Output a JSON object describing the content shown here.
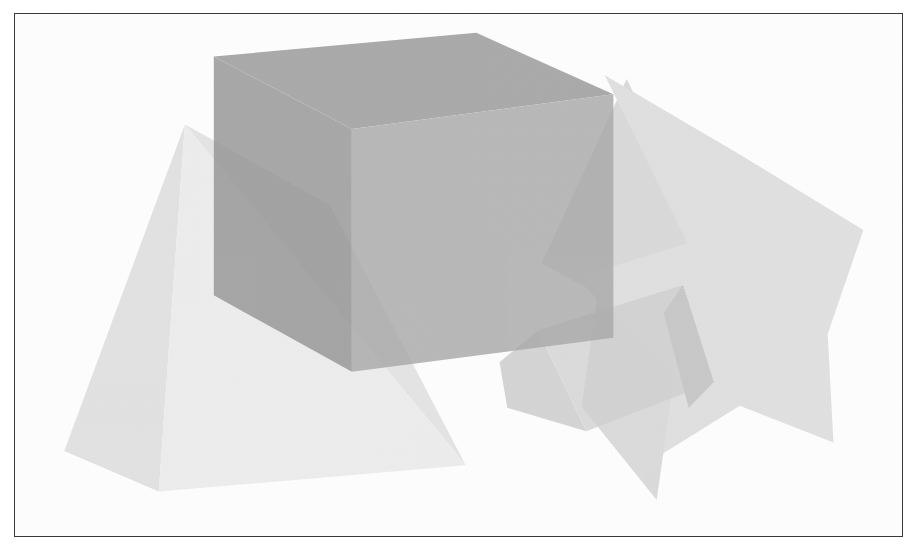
{
  "scene": {
    "title": "Overlapping translucent 3D solids",
    "background_color": "#ffffff",
    "frame_color": "#3a3a3a",
    "frame_style": "thin rectangular border",
    "render_mode": "grayscale halftone",
    "width": 919,
    "height": 553
  },
  "palette": {
    "cube_top_dark": "#6e6e6e",
    "cube_left_dark": "#6a6a6a",
    "cube_right_mid": "#8a8a8a",
    "pyramid_left_light": "#c8c8c8",
    "pyramid_front_lightest": "#dddddd",
    "star_body": "#c2c2c2",
    "star_shade": "#b4b4b4",
    "wedge_light": "#bdbdbd",
    "wedge_shade": "#aaaaaa",
    "overlap_blend": "#9a9a9a"
  },
  "shapes": [
    {
      "id": "cube",
      "name": "cube",
      "kind": "hexahedron",
      "opacity": 0.82,
      "faces": [
        {
          "name": "cube-top-face",
          "fill": "#6f6f6f",
          "points": "220,58 363,135 634,98 492,33"
        },
        {
          "name": "cube-left-face",
          "fill": "#6b6b6b",
          "points": "220,58 363,135 363,392 220,311"
        },
        {
          "name": "cube-right-face",
          "fill": "#878787",
          "points": "363,135 634,98 634,356 363,392"
        }
      ]
    },
    {
      "id": "pyramid",
      "name": "pyramid",
      "kind": "tetrahedron",
      "opacity": 0.72,
      "faces": [
        {
          "name": "pyramid-left-face",
          "fill": "#c9c9c9",
          "points": "190,130 65,476 163,519"
        },
        {
          "name": "pyramid-front-face",
          "fill": "#dedede",
          "points": "190,130 163,519 481,491"
        },
        {
          "name": "pyramid-right-face",
          "fill": "#cdcdcd",
          "points": "190,130 481,491 340,215"
        }
      ]
    },
    {
      "id": "star-prism",
      "name": "star-prism",
      "kind": "five-point-star-extrusion",
      "opacity": 0.7,
      "faces": [
        {
          "name": "star-front-face",
          "fill": "#c3c3c3",
          "points": "625,78 762,160 893,242 856,352 862,467 765,428 655,498 672,377 596,292 711,256"
        },
        {
          "name": "star-inner-shade",
          "fill": "#b5b5b5",
          "points": "625,78 711,256 596,292 540,262"
        }
      ]
    },
    {
      "id": "wedge",
      "name": "wedge-prism",
      "kind": "triangular-prism",
      "opacity": 0.74,
      "faces": [
        {
          "name": "wedge-top-face",
          "fill": "#bdbdbd",
          "points": "556,348 706,300 738,403 606,455"
        },
        {
          "name": "wedge-left-face",
          "fill": "#b0b0b0",
          "points": "556,348 606,455 524,430 516,382"
        },
        {
          "name": "wedge-right-face",
          "fill": "#a8a8a8",
          "points": "706,300 738,403 712,430 686,330"
        }
      ]
    }
  ],
  "annotations": {
    "shape_count": 4,
    "shape_names": [
      "cube",
      "pyramid",
      "star-prism",
      "wedge-prism"
    ]
  }
}
